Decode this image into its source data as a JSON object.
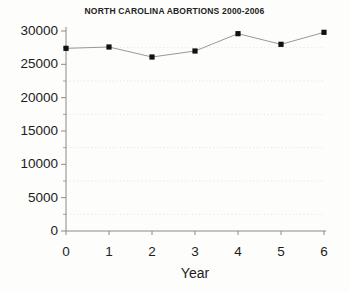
{
  "chart_data": {
    "type": "line",
    "title": "NORTH CAROLINA ABORTIONS 2000-2006",
    "xlabel": "Year",
    "ylabel": "",
    "x": [
      0,
      1,
      2,
      3,
      4,
      5,
      6
    ],
    "values": [
      27400,
      27600,
      26100,
      27000,
      29600,
      28000,
      29800
    ],
    "categories": [
      "0",
      "1",
      "2",
      "3",
      "4",
      "5",
      "6"
    ],
    "xtick_labels": [
      "0",
      "1",
      "2",
      "3",
      "4",
      "5",
      "6"
    ],
    "ytick_labels": [
      "0",
      "5000",
      "10000",
      "15000",
      "20000",
      "25000",
      "30000"
    ],
    "ytick_values": [
      0,
      5000,
      10000,
      15000,
      20000,
      25000,
      30000
    ],
    "minor_gridline_values": [
      2500,
      7500,
      12500,
      17500,
      22500,
      27500
    ],
    "xlim": [
      0,
      6
    ],
    "ylim": [
      0,
      30000
    ],
    "grid": true,
    "grid_style": "dotted",
    "legend": false,
    "marker": "square",
    "marker_color": "#111111",
    "line_color": "#8c8c8c",
    "axis_color": "#8a8a8a",
    "background_color": "#fdfdfc",
    "text_color": "#1c1c1c"
  },
  "axes": {
    "y_axis_name": "y-axis",
    "x_axis_name": "x-axis"
  }
}
